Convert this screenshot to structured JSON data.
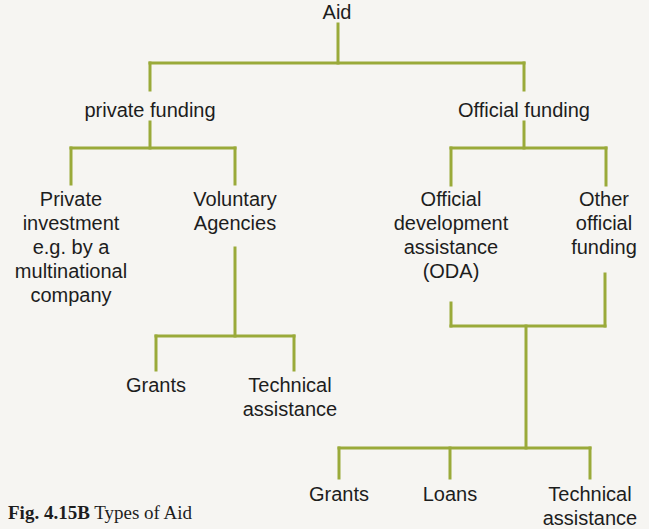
{
  "diagram": {
    "type": "tree",
    "line_color": "#9aaa3a",
    "root": {
      "label": "Aid",
      "children": [
        {
          "label": "private funding",
          "children": [
            {
              "label_lines": [
                "Private",
                "investment",
                "e.g. by a",
                "multinational",
                "company"
              ]
            },
            {
              "label_lines": [
                "Voluntary",
                "Agencies"
              ],
              "children": [
                {
                  "label_lines": [
                    "Grants"
                  ]
                },
                {
                  "label_lines": [
                    "Technical",
                    "assistance"
                  ]
                }
              ]
            }
          ]
        },
        {
          "label": "Official funding",
          "children": [
            {
              "label_lines": [
                "Official",
                "development",
                "assistance",
                "(ODA)"
              ]
            },
            {
              "label_lines": [
                "Other",
                "official",
                "funding"
              ]
            }
          ],
          "joint_children": [
            {
              "label_lines": [
                "Grants"
              ]
            },
            {
              "label_lines": [
                "Loans"
              ]
            },
            {
              "label_lines": [
                "Technical",
                "assistance"
              ]
            }
          ]
        }
      ]
    }
  },
  "nodes": {
    "aid": "Aid",
    "private_funding": "private funding",
    "official_funding": "Official funding",
    "private_investment": [
      "Private",
      "investment",
      "e.g. by a",
      "multinational",
      "company"
    ],
    "voluntary_agencies": [
      "Voluntary",
      "Agencies"
    ],
    "va_grants": "Grants",
    "va_technical": [
      "Technical",
      "assistance"
    ],
    "oda": [
      "Official",
      "development",
      "assistance",
      "(ODA)"
    ],
    "other_official": [
      "Other",
      "official",
      "funding"
    ],
    "off_grants": "Grants",
    "off_loans": "Loans",
    "off_technical": [
      "Technical",
      "assistance"
    ]
  },
  "caption": {
    "label": "Fig. 4.15B",
    "text": " Types of Aid"
  }
}
